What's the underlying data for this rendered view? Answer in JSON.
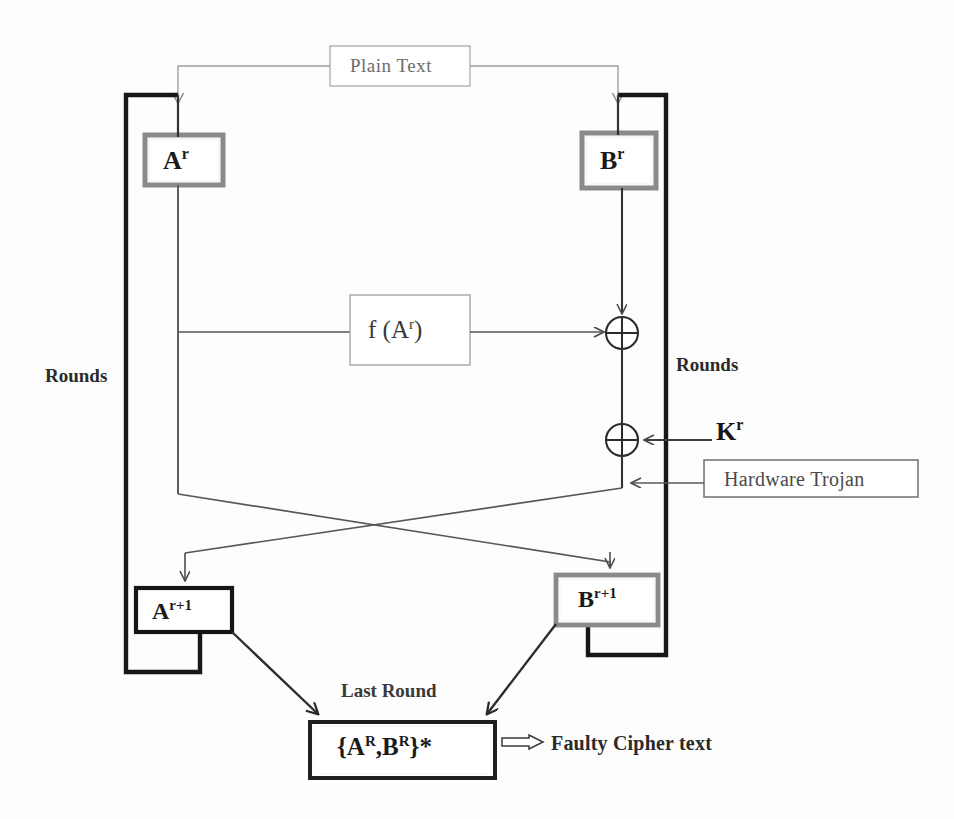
{
  "diagram": {
    "colors": {
      "thick_rail": "#1a1a1a",
      "thin_line": "#555555",
      "faint_line": "#9a9a9a",
      "box_gray_border": "#8d8d8d",
      "box_black_border": "#1a1a1a",
      "background": "#fdfdfd",
      "text": "#2a2a2a"
    },
    "nodes": {
      "plain_text": {
        "label": "Plain Text",
        "x": 330,
        "y": 46,
        "w": 140,
        "h": 40,
        "border": "faint"
      },
      "a_r": {
        "label_base": "A",
        "label_sup": "r",
        "x": 145,
        "y": 135,
        "w": 78,
        "h": 50,
        "border": "gray-thick"
      },
      "b_r": {
        "label_base": "B",
        "label_sup": "r",
        "x": 582,
        "y": 133,
        "w": 74,
        "h": 55,
        "border": "gray-thick"
      },
      "f_a_r": {
        "label_base": "f (A",
        "label_sup": "r",
        "label_tail": ")",
        "x": 350,
        "y": 295,
        "w": 120,
        "h": 70,
        "border": "faint"
      },
      "hardware_trojan": {
        "label": "Hardware Trojan",
        "x": 704,
        "y": 460,
        "w": 214,
        "h": 37,
        "border": "thin"
      },
      "a_r1": {
        "label_base": "A",
        "label_sup": "r+1",
        "x": 136,
        "y": 588,
        "w": 96,
        "h": 44,
        "border": "black-thick"
      },
      "b_r1": {
        "label_base": "B",
        "label_sup": "r+1",
        "x": 556,
        "y": 575,
        "w": 102,
        "h": 50,
        "border": "gray-thick"
      },
      "cipher": {
        "label_prefix": "{A",
        "label_sup1": "R",
        "label_mid": ",B",
        "label_sup2": "R",
        "label_suffix": "}*",
        "x": 310,
        "y": 722,
        "w": 185,
        "h": 56,
        "border": "black-thick"
      }
    },
    "xor_gates": [
      {
        "name": "xor-f-output",
        "cx": 622,
        "cy": 333,
        "r": 16
      },
      {
        "name": "xor-round-key",
        "cx": 622,
        "cy": 440,
        "r": 16
      }
    ],
    "labels": {
      "rounds_left": {
        "text": "Rounds",
        "x": 45,
        "y": 366
      },
      "rounds_right": {
        "text": "Rounds",
        "x": 676,
        "y": 355
      },
      "key": {
        "base": "K",
        "sup": "r",
        "x": 716,
        "y": 417
      },
      "last_round": {
        "text": "Last Round",
        "x": 341,
        "y": 681
      },
      "faulty_cipher": {
        "text": "Faulty Cipher text",
        "x": 553,
        "y": 732
      }
    },
    "icons": {
      "xor": "xor-gate-icon",
      "arrow": "arrowhead-icon",
      "double_arrow": "double-arrow-icon"
    }
  }
}
